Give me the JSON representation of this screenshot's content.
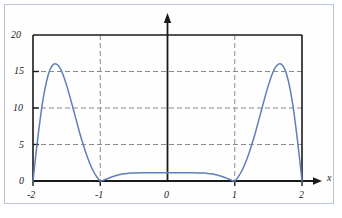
{
  "figure": {
    "background_color": "#ffffff",
    "border_color": "#b9c4d6",
    "axis_color": "#1a1a1a",
    "grid_color": "#8a8a8a",
    "curve_color": "#5f7fb8"
  },
  "chart_data": {
    "type": "line",
    "title": "",
    "subtitle": "",
    "xlabel": "x",
    "ylabel": "",
    "xlim": [
      -2,
      2
    ],
    "ylim": [
      0,
      20
    ],
    "grid": true,
    "grid_style": "dashed",
    "legend": "none",
    "x_ticks": [
      -2,
      -1,
      0,
      1,
      2
    ],
    "x_tick_labels": [
      "-2",
      "-1",
      "0",
      "1",
      "2"
    ],
    "y_ticks": [
      0,
      5,
      10,
      15,
      20
    ],
    "y_tick_labels": [
      "0",
      "5",
      "10",
      "15",
      "20"
    ],
    "y_axis_arrow": true,
    "x_axis_arrow": true,
    "annotations": [],
    "series": [
      {
        "name": "curve",
        "color": "#5f7fb8",
        "zeros": [
          -2,
          -1,
          1,
          2
        ],
        "peaks": [
          {
            "x": -1.65,
            "y": 16
          },
          {
            "x": 1.65,
            "y": 16
          }
        ],
        "plateau": {
          "x_range": [
            -0.55,
            0.55
          ],
          "y": 1.1
        },
        "x": [
          -2.0,
          -1.95,
          -1.9,
          -1.85,
          -1.8,
          -1.75,
          -1.7,
          -1.65,
          -1.6,
          -1.55,
          -1.5,
          -1.45,
          -1.4,
          -1.35,
          -1.3,
          -1.25,
          -1.2,
          -1.15,
          -1.1,
          -1.05,
          -1.0,
          -0.95,
          -0.9,
          -0.85,
          -0.8,
          -0.75,
          -0.7,
          -0.65,
          -0.6,
          -0.55,
          -0.5,
          -0.45,
          -0.4,
          -0.35,
          -0.3,
          -0.25,
          -0.2,
          -0.15,
          -0.1,
          -0.05,
          0.0,
          0.05,
          0.1,
          0.15,
          0.2,
          0.25,
          0.3,
          0.35,
          0.4,
          0.45,
          0.5,
          0.55,
          0.6,
          0.65,
          0.7,
          0.75,
          0.8,
          0.85,
          0.9,
          0.95,
          1.0,
          1.05,
          1.1,
          1.15,
          1.2,
          1.25,
          1.3,
          1.35,
          1.4,
          1.45,
          1.5,
          1.55,
          1.6,
          1.65,
          1.7,
          1.75,
          1.8,
          1.85,
          1.9,
          1.95,
          2.0
        ],
        "y": [
          0.0,
          4.2,
          8.0,
          11.2,
          13.6,
          15.2,
          15.95,
          16.0,
          15.5,
          14.5,
          13.1,
          11.5,
          9.8,
          8.1,
          6.4,
          4.9,
          3.5,
          2.3,
          1.3,
          0.55,
          0.0,
          0.12,
          0.3,
          0.48,
          0.65,
          0.79,
          0.9,
          0.98,
          1.04,
          1.08,
          1.1,
          1.11,
          1.12,
          1.12,
          1.12,
          1.13,
          1.13,
          1.13,
          1.13,
          1.13,
          1.13,
          1.13,
          1.13,
          1.13,
          1.13,
          1.13,
          1.12,
          1.12,
          1.12,
          1.11,
          1.1,
          1.08,
          1.04,
          0.98,
          0.9,
          0.79,
          0.65,
          0.48,
          0.3,
          0.12,
          0.0,
          0.55,
          1.3,
          2.3,
          3.5,
          4.9,
          6.4,
          8.1,
          9.8,
          11.5,
          13.1,
          14.5,
          15.5,
          16.0,
          15.95,
          15.2,
          13.6,
          11.2,
          8.0,
          4.2,
          0.0
        ]
      }
    ]
  }
}
